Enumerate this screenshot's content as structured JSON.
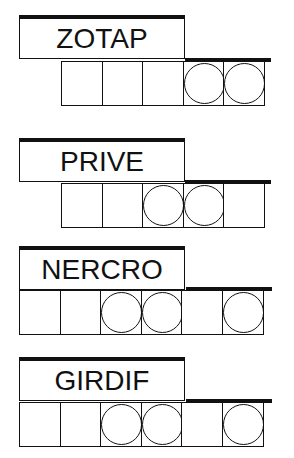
{
  "puzzles": [
    {
      "word": "ZOTAP",
      "cells": [
        false,
        false,
        false,
        true,
        true
      ],
      "offset": 1
    },
    {
      "word": "PRIVE",
      "cells": [
        false,
        false,
        true,
        true,
        false
      ],
      "offset": 1
    },
    {
      "word": "NERCRO",
      "cells": [
        false,
        false,
        true,
        true,
        false,
        true
      ],
      "offset": 0
    },
    {
      "word": "GIRDIF",
      "cells": [
        false,
        false,
        true,
        true,
        false,
        true
      ],
      "offset": 0
    }
  ]
}
